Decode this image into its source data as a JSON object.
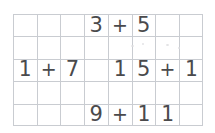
{
  "worksheet": {
    "title": "Grid paper addition expressions",
    "background_color": "#ffffff",
    "grid": {
      "columns": 8,
      "rows": 5,
      "line_color": "#c9ccd1",
      "cell_width": 23.75,
      "cell_height": 22.4,
      "origin_x": 13,
      "origin_y": 14,
      "width": 190,
      "height": 112
    },
    "ink_color": "#4a4a4c",
    "expressions": [
      {
        "id": "expression-top",
        "text": "3 + 5",
        "row": 0,
        "operands": [
          "3",
          "5"
        ],
        "operator": "+",
        "cells": [
          {
            "row": 0,
            "col": 3,
            "char": "3",
            "kind": "digit"
          },
          {
            "row": 0,
            "col": 4,
            "char": "+",
            "kind": "plus"
          },
          {
            "row": 0,
            "col": 5,
            "char": "5",
            "kind": "digit"
          }
        ]
      },
      {
        "id": "expression-middle-left",
        "text": "1 + 7",
        "row": 2,
        "operands": [
          "1",
          "7"
        ],
        "operator": "+",
        "cells": [
          {
            "row": 2,
            "col": 0,
            "char": "1",
            "kind": "one"
          },
          {
            "row": 2,
            "col": 1,
            "char": "+",
            "kind": "plus"
          },
          {
            "row": 2,
            "col": 2,
            "char": "7",
            "kind": "digit"
          }
        ]
      },
      {
        "id": "expression-middle-right",
        "text": "15 + 1",
        "row": 2,
        "operands": [
          "15",
          "1"
        ],
        "operator": "+",
        "cells": [
          {
            "row": 2,
            "col": 4,
            "char": "1",
            "kind": "one"
          },
          {
            "row": 2,
            "col": 5,
            "char": "5",
            "kind": "digit"
          },
          {
            "row": 2,
            "col": 6,
            "char": "+",
            "kind": "plus"
          },
          {
            "row": 2,
            "col": 7,
            "char": "1",
            "kind": "one"
          }
        ]
      },
      {
        "id": "expression-bottom",
        "text": "9 + 11",
        "row": 4,
        "operands": [
          "9",
          "11"
        ],
        "operator": "+",
        "cells": [
          {
            "row": 4,
            "col": 3,
            "char": "9",
            "kind": "digit"
          },
          {
            "row": 4,
            "col": 4,
            "char": "+",
            "kind": "plus"
          },
          {
            "row": 4,
            "col": 5,
            "char": "1",
            "kind": "one"
          },
          {
            "row": 4,
            "col": 6,
            "char": "1",
            "kind": "one"
          }
        ]
      }
    ],
    "smudges": [
      {
        "x": 131,
        "y": 45,
        "w": 3,
        "h": 2
      },
      {
        "x": 142,
        "y": 43,
        "w": 2,
        "h": 2
      },
      {
        "x": 166,
        "y": 44,
        "w": 3,
        "h": 2
      },
      {
        "x": 178,
        "y": 47,
        "w": 2,
        "h": 2
      }
    ]
  }
}
